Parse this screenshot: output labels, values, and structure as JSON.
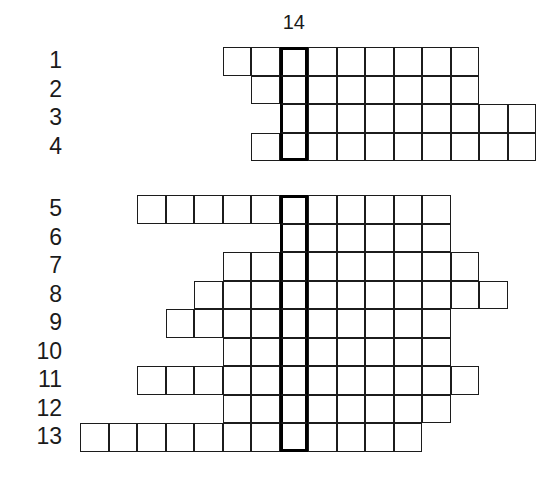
{
  "puzzle": {
    "type": "crossword-skeleton-grid",
    "column_label": "14",
    "highlight_column_index": 7,
    "row_labels": [
      "1",
      "2",
      "3",
      "4",
      "5",
      "6",
      "7",
      "8",
      "9",
      "10",
      "11",
      "12",
      "13"
    ],
    "geometry": {
      "cell_size": 28.5,
      "origin_x": 80,
      "block_a_origin_y": 47,
      "block_b_origin_y": 195,
      "block_gap_rows": 1
    },
    "rows": [
      {
        "label": "1",
        "block": "a",
        "block_row": 0,
        "start_col": 5,
        "end_col": 13,
        "cells": 9
      },
      {
        "label": "2",
        "block": "a",
        "block_row": 1,
        "start_col": 6,
        "end_col": 13,
        "cells": 8
      },
      {
        "label": "3",
        "block": "a",
        "block_row": 2,
        "start_col": 7,
        "end_col": 15,
        "cells": 9
      },
      {
        "label": "4",
        "block": "a",
        "block_row": 3,
        "start_col": 6,
        "end_col": 15,
        "cells": 10
      },
      {
        "label": "5",
        "block": "b",
        "block_row": 0,
        "start_col": 2,
        "end_col": 12,
        "cells": 11
      },
      {
        "label": "6",
        "block": "b",
        "block_row": 1,
        "start_col": 7,
        "end_col": 12,
        "cells": 6
      },
      {
        "label": "7",
        "block": "b",
        "block_row": 2,
        "start_col": 5,
        "end_col": 13,
        "cells": 9
      },
      {
        "label": "8",
        "block": "b",
        "block_row": 3,
        "start_col": 4,
        "end_col": 14,
        "cells": 11
      },
      {
        "label": "9",
        "block": "b",
        "block_row": 4,
        "start_col": 3,
        "end_col": 12,
        "cells": 10
      },
      {
        "label": "10",
        "block": "b",
        "block_row": 5,
        "start_col": 5,
        "end_col": 12,
        "cells": 8
      },
      {
        "label": "11",
        "block": "b",
        "block_row": 6,
        "start_col": 2,
        "end_col": 13,
        "cells": 12
      },
      {
        "label": "12",
        "block": "b",
        "block_row": 7,
        "start_col": 5,
        "end_col": 12,
        "cells": 8
      },
      {
        "label": "13",
        "block": "b",
        "block_row": 8,
        "start_col": 0,
        "end_col": 11,
        "cells": 12
      }
    ],
    "colors": {
      "grid_line": "#1c1c1c",
      "highlight_line": "#000000",
      "cell_fill": "#ffffff",
      "background": "#ffffff",
      "text": "#1b1b1b"
    }
  }
}
